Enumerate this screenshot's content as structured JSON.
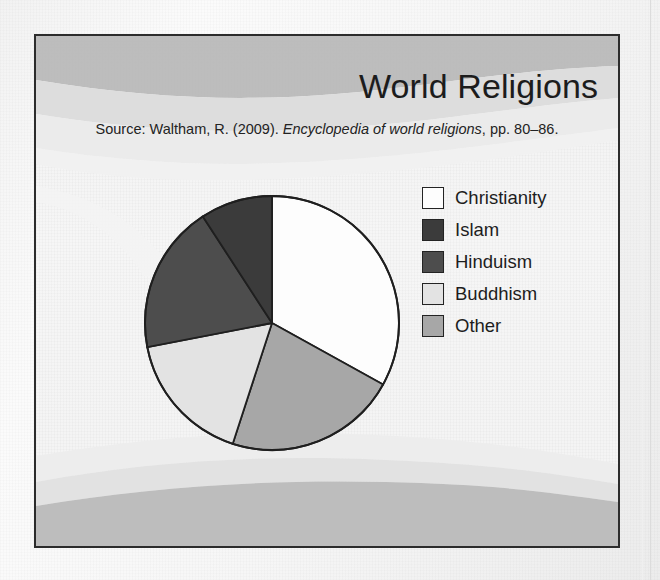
{
  "figure": {
    "title": "World Religions",
    "source": {
      "prefix": "Source: Waltham, R. (2009).",
      "italic": "Encyclopedia of world religions",
      "suffix": ", pp. 80–86."
    }
  },
  "legend": {
    "items": [
      {
        "label": "Christianity",
        "swatch_name": "legend-swatch-christianity",
        "color": "#fdfdfd"
      },
      {
        "label": "Islam",
        "swatch_name": "legend-swatch-islam",
        "color": "#3b3b3b"
      },
      {
        "label": "Hinduism",
        "swatch_name": "legend-swatch-hinduism",
        "color": "#4d4d4d"
      },
      {
        "label": "Buddhism",
        "swatch_name": "legend-swatch-buddhism",
        "color": "#e3e3e3"
      },
      {
        "label": "Other",
        "swatch_name": "legend-swatch-other",
        "color": "#a7a7a7"
      }
    ]
  },
  "chart_data": {
    "type": "pie",
    "title": "World Religions",
    "xlabel": "",
    "ylabel": "",
    "legend_position": "right",
    "grid": false,
    "start_angle_deg": 0,
    "direction": "clockwise",
    "categories": [
      "Christianity",
      "Other",
      "Buddhism",
      "Hinduism",
      "Islam"
    ],
    "values": [
      33,
      22,
      17,
      19,
      9
    ],
    "slices": [
      {
        "label": "Christianity",
        "value": 33,
        "color": "#fdfdfd",
        "start_deg": 0,
        "end_deg": 119
      },
      {
        "label": "Other",
        "value": 22,
        "color": "#a7a7a7",
        "start_deg": 119,
        "end_deg": 198
      },
      {
        "label": "Buddhism",
        "value": 17,
        "color": "#e3e3e3",
        "start_deg": 198,
        "end_deg": 259
      },
      {
        "label": "Hinduism",
        "value": 19,
        "color": "#4d4d4d",
        "start_deg": 259,
        "end_deg": 327
      },
      {
        "label": "Islam",
        "value": 9,
        "color": "#3b3b3b",
        "start_deg": 327,
        "end_deg": 360
      }
    ],
    "units": "percent",
    "stroke_color": "#1f1f1f"
  },
  "style": {
    "frame_border_color": "#2c2c2c",
    "wave_light": "#ececec",
    "wave_mid": "#e0e0e0",
    "wave_dark": "#b8b8b8",
    "paper_background": "#f4f4f4"
  }
}
